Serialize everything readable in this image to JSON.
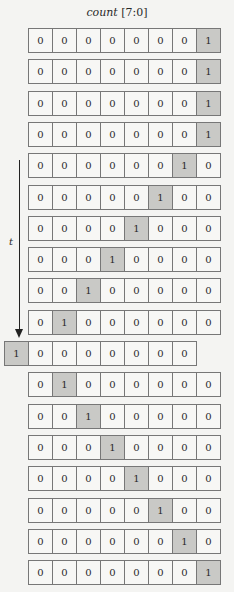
{
  "title": {
    "name": "count",
    "range": " [7:0]"
  },
  "axis": {
    "label": "t"
  },
  "rows": [
    {
      "bits": [
        "0",
        "0",
        "0",
        "0",
        "0",
        "0",
        "0",
        "1"
      ],
      "shift": 0
    },
    {
      "bits": [
        "0",
        "0",
        "0",
        "0",
        "0",
        "0",
        "0",
        "1"
      ],
      "shift": 0
    },
    {
      "bits": [
        "0",
        "0",
        "0",
        "0",
        "0",
        "0",
        "0",
        "1"
      ],
      "shift": 0
    },
    {
      "bits": [
        "0",
        "0",
        "0",
        "0",
        "0",
        "0",
        "0",
        "1"
      ],
      "shift": 0
    },
    {
      "bits": [
        "0",
        "0",
        "0",
        "0",
        "0",
        "0",
        "1",
        "0"
      ],
      "shift": 0
    },
    {
      "bits": [
        "0",
        "0",
        "0",
        "0",
        "0",
        "1",
        "0",
        "0"
      ],
      "shift": 0
    },
    {
      "bits": [
        "0",
        "0",
        "0",
        "0",
        "1",
        "0",
        "0",
        "0"
      ],
      "shift": 0
    },
    {
      "bits": [
        "0",
        "0",
        "0",
        "1",
        "0",
        "0",
        "0",
        "0"
      ],
      "shift": 0
    },
    {
      "bits": [
        "0",
        "0",
        "1",
        "0",
        "0",
        "0",
        "0",
        "0"
      ],
      "shift": 0
    },
    {
      "bits": [
        "0",
        "1",
        "0",
        "0",
        "0",
        "0",
        "0",
        "0"
      ],
      "shift": 0
    },
    {
      "bits": [
        "1",
        "0",
        "0",
        "0",
        "0",
        "0",
        "0",
        "0"
      ],
      "shift": -1
    },
    {
      "bits": [
        "0",
        "1",
        "0",
        "0",
        "0",
        "0",
        "0",
        "0"
      ],
      "shift": 0
    },
    {
      "bits": [
        "0",
        "0",
        "1",
        "0",
        "0",
        "0",
        "0",
        "0"
      ],
      "shift": 0
    },
    {
      "bits": [
        "0",
        "0",
        "0",
        "1",
        "0",
        "0",
        "0",
        "0"
      ],
      "shift": 0
    },
    {
      "bits": [
        "0",
        "0",
        "0",
        "0",
        "1",
        "0",
        "0",
        "0"
      ],
      "shift": 0
    },
    {
      "bits": [
        "0",
        "0",
        "0",
        "0",
        "0",
        "1",
        "0",
        "0"
      ],
      "shift": 0
    },
    {
      "bits": [
        "0",
        "0",
        "0",
        "0",
        "0",
        "0",
        "1",
        "0"
      ],
      "shift": 0
    },
    {
      "bits": [
        "0",
        "0",
        "0",
        "0",
        "0",
        "0",
        "0",
        "1"
      ],
      "shift": 0
    }
  ],
  "colors": {
    "cell_bg": "#f7f7f5",
    "active_bg": "#c9c9c6",
    "border": "#777777"
  }
}
